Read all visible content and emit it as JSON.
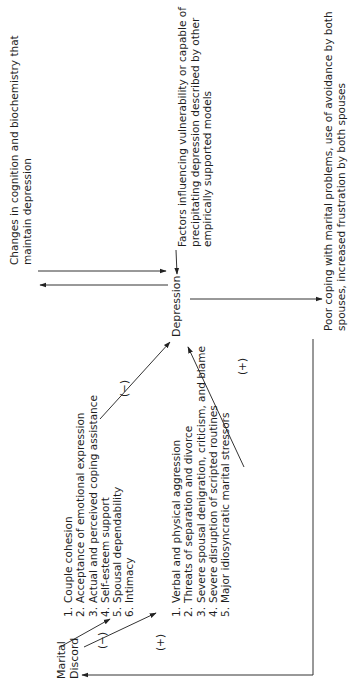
{
  "diagram": {
    "orientation": "rotated-90-ccw",
    "nodes": {
      "marital_discord": {
        "line1": "Marital",
        "line2": "Discord"
      },
      "depression": {
        "label": "Depression"
      },
      "changes": {
        "line1": "Changes in cognition and biochemistry that",
        "line2": "maintain depression"
      },
      "factors": {
        "line1": "Factors influencing vulnerability or capable of",
        "line2": "precipitating depression described by other",
        "line3": "empirically supported models"
      },
      "poor_coping": {
        "line1": "Poor coping with marital problems, use of avoidance by both",
        "line2": "spouses, increased frustration by both spouses"
      }
    },
    "protective_list": {
      "sign_in": "(−)",
      "sign_out": "(−)",
      "items": [
        {
          "num": "1.",
          "text": "Couple cohesion"
        },
        {
          "num": "2.",
          "text": "Acceptance of emotional expression"
        },
        {
          "num": "3.",
          "text": "Actual and perceived coping assistance"
        },
        {
          "num": "4.",
          "text": "Self-esteem support"
        },
        {
          "num": "5.",
          "text": "Spousal dependability"
        },
        {
          "num": "6.",
          "text": "Intimacy"
        }
      ]
    },
    "stressor_list": {
      "sign_in": "(+)",
      "sign_out": "(+)",
      "items": [
        {
          "num": "1.",
          "text": "Verbal and physical aggression"
        },
        {
          "num": "2.",
          "text": "Threats of separation and divorce"
        },
        {
          "num": "3.",
          "text": "Severe spousal denigration, criticism, and blame"
        },
        {
          "num": "4.",
          "text": "Severe disruption of scripted routines"
        },
        {
          "num": "5.",
          "text": "Major idiosyncratic marital stressors"
        }
      ]
    },
    "colors": {
      "text": "#1e1e1e",
      "line": "#333333",
      "background": "#ffffff"
    }
  }
}
